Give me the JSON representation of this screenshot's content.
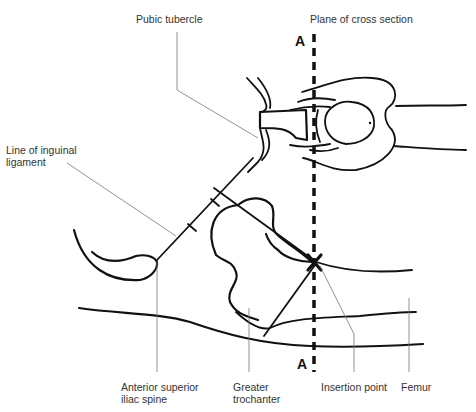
{
  "labels": {
    "pubic_tubercle": "Pubic tubercle",
    "plane_of_cross_section": "Plane of cross section",
    "line_of_inguinal_ligament": "Line of inguinal\nligament",
    "anterior_superior_iliac_spine": "Anterior superior\niliac spine",
    "greater_trochanter": "Greater\ntrochanter",
    "insertion_point": "Insertion point",
    "femur": "Femur"
  },
  "markers": {
    "plane_top": "A",
    "plane_bottom": "A",
    "insertion": "X"
  },
  "colors": {
    "ink": "#111111",
    "leader": "#777777",
    "text": "#333333",
    "background": "#ffffff"
  }
}
